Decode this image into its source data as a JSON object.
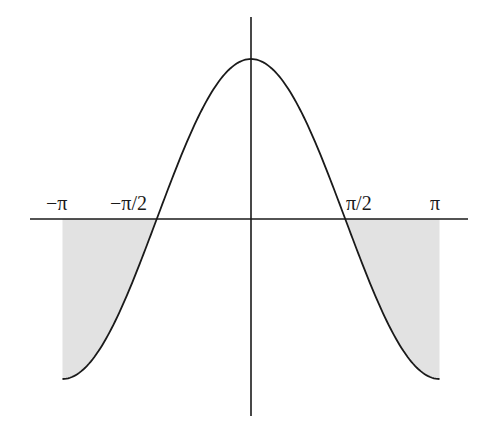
{
  "chart_data": {
    "type": "line",
    "title": "",
    "function": "y = cos(x)",
    "xlabel": "",
    "ylabel": "",
    "xlim": [
      -3.14159,
      3.14159
    ],
    "ylim": [
      -1,
      1
    ],
    "grid": false,
    "legend": null,
    "x_tick_labels": [
      "−π",
      "−π/2",
      "π/2",
      "π"
    ],
    "x_tick_values": [
      -3.14159,
      -1.5708,
      1.5708,
      3.14159
    ],
    "series": [
      {
        "name": "cos(x)",
        "x": [
          -3.14159,
          -2.35619,
          -1.5708,
          -0.7854,
          0,
          0.7854,
          1.5708,
          2.35619,
          3.14159
        ],
        "values": [
          -1,
          -0.7071,
          0,
          0.7071,
          1,
          0.7071,
          0,
          -0.7071,
          -1
        ]
      }
    ],
    "shaded_regions": [
      {
        "x_from": -3.14159,
        "x_to": -1.5708,
        "description": "area between curve and x-axis, below axis"
      },
      {
        "x_from": 1.5708,
        "x_to": 3.14159,
        "description": "area between curve and x-axis, below axis"
      }
    ],
    "colors": {
      "curve": "#1a1a1a",
      "axes": "#1a1a1a",
      "shade": "#e2e2e2"
    }
  },
  "labels": {
    "neg_pi": "−π",
    "neg_half_pi": "−π/2",
    "half_pi": "π/2",
    "pi": "π"
  }
}
